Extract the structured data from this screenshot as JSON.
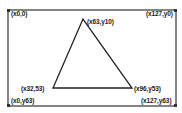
{
  "display": {
    "width_px": 128,
    "height_px": 64,
    "stroke_color": "#222222",
    "background": "#ffffff"
  },
  "frame": {
    "corners": [
      {
        "id": "top-left",
        "label": "(x0,0)"
      },
      {
        "id": "top-right",
        "label": "(x127,y0)"
      },
      {
        "id": "bottom-left",
        "label": "(x0,y63)"
      },
      {
        "id": "bottom-right",
        "label": "(x127,y63)"
      }
    ]
  },
  "triangle": {
    "vertices": [
      {
        "id": "apex",
        "label": "(x63,y10)"
      },
      {
        "id": "bottom-left",
        "label": "(x32,53)"
      },
      {
        "id": "bottom-right",
        "label": "(x96,y53)"
      }
    ]
  }
}
